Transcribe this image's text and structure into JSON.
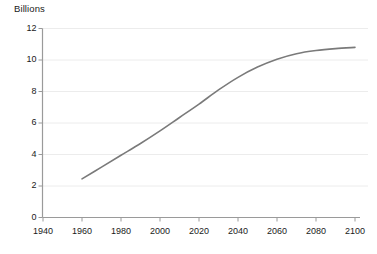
{
  "chart_data": {
    "type": "line",
    "title": "Billions",
    "xlabel": "",
    "ylabel": "Billions",
    "xlim": [
      1930,
      2110
    ],
    "ylim": [
      0,
      12
    ],
    "grid": true,
    "legend": "none",
    "x_ticks": [
      1940,
      1960,
      1980,
      2000,
      2020,
      2040,
      2060,
      2080,
      2100
    ],
    "y_ticks": [
      0,
      2,
      4,
      6,
      8,
      10,
      12
    ],
    "series": [
      {
        "name": "World population",
        "color": "#7a7a7a",
        "x": [
          1960,
          1970,
          1980,
          1990,
          2000,
          2010,
          2020,
          2030,
          2040,
          2050,
          2060,
          2070,
          2080,
          2090,
          2100
        ],
        "values": [
          2.45,
          3.2,
          3.95,
          4.7,
          5.5,
          6.35,
          7.2,
          8.1,
          8.9,
          9.55,
          10.05,
          10.4,
          10.6,
          10.72,
          10.8
        ]
      }
    ]
  },
  "labels": {
    "y_axis_title": "Billions",
    "y_tick_texts": [
      "12",
      "10",
      "8",
      "6",
      "4",
      "2",
      "0"
    ],
    "x_tick_texts": [
      "1940",
      "1960",
      "1980",
      "2000",
      "2020",
      "2040",
      "2060",
      "2080",
      "2100"
    ]
  },
  "colors": {
    "line": "#7a7a7a",
    "grid": "#ececec",
    "axis": "#9a9a9a",
    "text": "#1a1a1a",
    "background": "#ffffff"
  }
}
